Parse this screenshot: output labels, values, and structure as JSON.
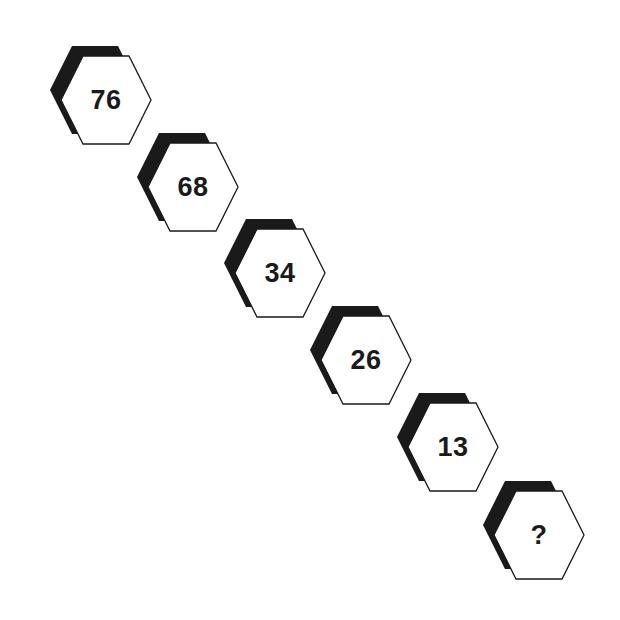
{
  "puzzle": {
    "type": "number-sequence",
    "cells": [
      {
        "label": "76",
        "cx": 106,
        "cy": 100
      },
      {
        "label": "68",
        "cx": 193,
        "cy": 187
      },
      {
        "label": "34",
        "cx": 280,
        "cy": 273
      },
      {
        "label": "26",
        "cx": 366,
        "cy": 360
      },
      {
        "label": "13",
        "cx": 453,
        "cy": 447
      },
      {
        "label": "?",
        "cx": 539,
        "cy": 535
      }
    ]
  },
  "colors": {
    "background": "#ffffff",
    "hex_fill": "#ffffff",
    "hex_stroke": "#1a1a1a",
    "shadow": "#1a1a1a",
    "text": "#1a1a1a"
  }
}
